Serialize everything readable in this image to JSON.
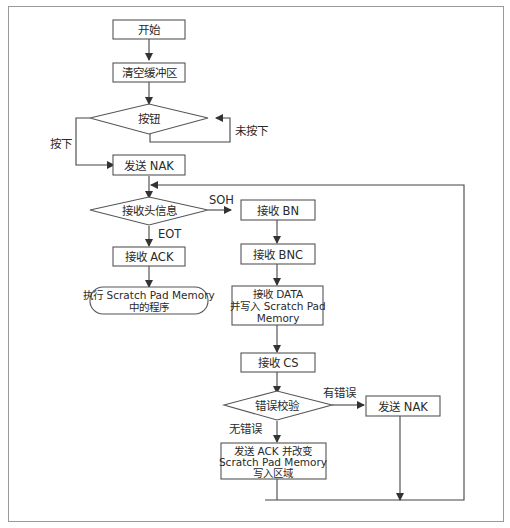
{
  "diagram": {
    "type": "flowchart",
    "nodes": {
      "start": {
        "label": "开始",
        "shape": "rect"
      },
      "clear_buffer": {
        "label": "清空缓冲区",
        "shape": "rect"
      },
      "button": {
        "label": "按钮",
        "shape": "diamond"
      },
      "send_nak_1": {
        "label": "发送 NAK",
        "shape": "rect"
      },
      "recv_header": {
        "label": "接收头信息",
        "shape": "diamond"
      },
      "recv_ack": {
        "label": "接收 ACK",
        "shape": "rect"
      },
      "exec_program": {
        "line1": "执行 Scratch Pad Memory",
        "line2": "中的程序",
        "shape": "rounded"
      },
      "recv_bn": {
        "label": "接收 BN",
        "shape": "rect"
      },
      "recv_bnc": {
        "label": "接收 BNC",
        "shape": "rect"
      },
      "recv_data": {
        "line1": "接收 DATA",
        "line2": "并写入 Scratch Pad",
        "line3": "Memory",
        "shape": "rect"
      },
      "recv_cs": {
        "label": "接收 CS",
        "shape": "rect"
      },
      "error_check": {
        "label": "错误校验",
        "shape": "diamond"
      },
      "send_nak_2": {
        "label": "发送 NAK",
        "shape": "rect"
      },
      "send_ack": {
        "line1": "发送 ACK 并改变",
        "line2": "Scratch Pad Memory",
        "line3": "写入区域",
        "shape": "rect"
      }
    },
    "edge_labels": {
      "pressed": "按下",
      "not_pressed": "未按下",
      "soh": "SOH",
      "eot": "EOT",
      "has_error": "有错误",
      "no_error": "无错误"
    },
    "edges": [
      {
        "from": "start",
        "to": "clear_buffer"
      },
      {
        "from": "clear_buffer",
        "to": "button"
      },
      {
        "from": "button",
        "to": "button",
        "label": "未按下"
      },
      {
        "from": "button",
        "to": "send_nak_1",
        "label": "按下"
      },
      {
        "from": "send_nak_1",
        "to": "recv_header"
      },
      {
        "from": "recv_header",
        "to": "recv_bn",
        "label": "SOH"
      },
      {
        "from": "recv_header",
        "to": "recv_ack",
        "label": "EOT"
      },
      {
        "from": "recv_ack",
        "to": "exec_program"
      },
      {
        "from": "recv_bn",
        "to": "recv_bnc"
      },
      {
        "from": "recv_bnc",
        "to": "recv_data"
      },
      {
        "from": "recv_data",
        "to": "recv_cs"
      },
      {
        "from": "recv_cs",
        "to": "error_check"
      },
      {
        "from": "error_check",
        "to": "send_nak_2",
        "label": "有错误"
      },
      {
        "from": "error_check",
        "to": "send_ack",
        "label": "无错误"
      },
      {
        "from": "send_nak_2",
        "to": "recv_header"
      },
      {
        "from": "send_ack",
        "to": "recv_header"
      }
    ]
  }
}
